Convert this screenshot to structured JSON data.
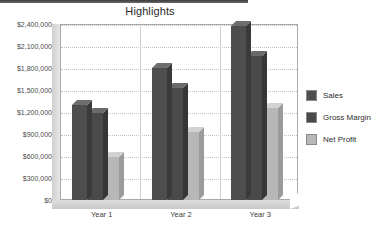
{
  "chart_data": {
    "type": "bar",
    "title": "Highlights",
    "xlabel": "",
    "ylabel": "",
    "categories": [
      "Year 1",
      "Year 2",
      "Year 3"
    ],
    "series": [
      {
        "name": "Sales",
        "color": "#4e4e4e",
        "values": [
          1300000,
          1800000,
          2370000
        ]
      },
      {
        "name": "Gross Margin",
        "color": "#4a4a4a",
        "values": [
          1180000,
          1530000,
          1970000
        ]
      },
      {
        "name": "Net Profit",
        "color": "#b7b7b7",
        "values": [
          580000,
          930000,
          1250000
        ]
      }
    ],
    "ylim": [
      0,
      2400000
    ],
    "ytick_values": [
      0,
      300000,
      600000,
      900000,
      1200000,
      1500000,
      1800000,
      2100000,
      2400000
    ],
    "ytick_labels": [
      "$0",
      "$300,000",
      "$600,000",
      "$900,000",
      "$1,200,000",
      "$1,500,000",
      "$1,800,000",
      "$2,100,000",
      "$2,400,000"
    ],
    "grid": true,
    "legend_position": "right",
    "style": "3d-column",
    "legend_entries": [
      "Sales",
      "Gross Margin",
      "Net Profit"
    ]
  }
}
